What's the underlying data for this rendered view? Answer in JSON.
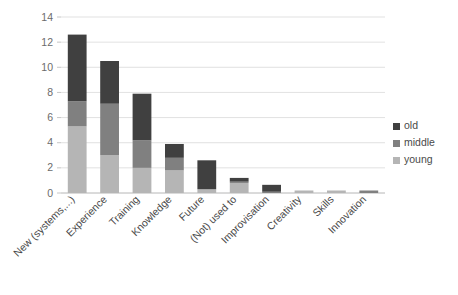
{
  "chart_data": {
    "type": "bar",
    "subtype": "stacked-vertical",
    "title": "",
    "xlabel": "",
    "ylabel": "",
    "ylim": [
      0,
      14
    ],
    "ytick_step": 2,
    "yticks": [
      "0",
      "2",
      "4",
      "6",
      "8",
      "10",
      "12",
      "14"
    ],
    "grid": true,
    "grid_axis": "y",
    "legend_position": "right",
    "category_label_rotation": 45,
    "categories": [
      "New (systems,...)",
      "Experience",
      "Training",
      "Knowledge",
      "Future",
      "(Not) used to",
      "Improvisation",
      "Creativity",
      "Skills",
      "Innovation"
    ],
    "series": [
      {
        "name": "young",
        "color": "#b5b5b5",
        "values": [
          5.3,
          3.0,
          2.0,
          1.8,
          0.3,
          0.8,
          0.0,
          0.2,
          0.2,
          0.0
        ]
      },
      {
        "name": "middle",
        "color": "#808080",
        "values": [
          2.0,
          4.1,
          2.2,
          1.0,
          0.0,
          0.1,
          0.1,
          0.0,
          0.0,
          0.2
        ]
      },
      {
        "name": "old",
        "color": "#404040",
        "values": [
          5.3,
          3.4,
          3.7,
          1.1,
          2.3,
          0.3,
          0.55,
          0.0,
          0.0,
          0.0
        ]
      }
    ],
    "totals": [
      12.6,
      10.5,
      7.9,
      3.9,
      2.6,
      1.2,
      0.65,
      0.2,
      0.2,
      0.2
    ],
    "legend_entries": [
      {
        "label": "old",
        "color": "#404040"
      },
      {
        "label": "middle",
        "color": "#808080"
      },
      {
        "label": "young",
        "color": "#b5b5b5"
      }
    ],
    "colors": {
      "old": "#404040",
      "middle": "#808080",
      "young": "#b5b5b5",
      "gridline": "#d9d9d9",
      "axis": "#bfbfbf",
      "tick_text": "#6b6b6b",
      "category_text": "#4a4a4a",
      "background": "#ffffff"
    }
  }
}
